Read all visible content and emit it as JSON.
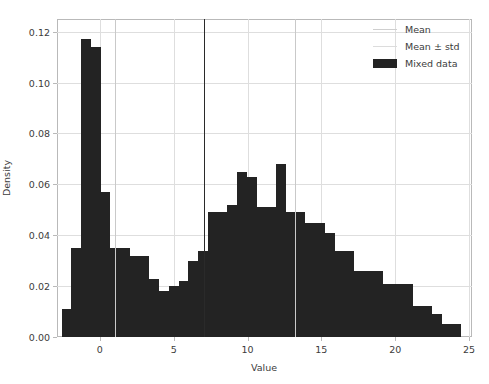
{
  "chart_data": {
    "type": "bar",
    "title": "",
    "xlabel": "Value",
    "ylabel": "Density",
    "xlim": [
      -2.9,
      25.2
    ],
    "ylim": [
      0.0,
      0.125
    ],
    "grid": true,
    "legend_position": "upper right",
    "bin_width": 0.66,
    "x_ticks": [
      0,
      5,
      10,
      15,
      20,
      25
    ],
    "x_tick_labels": [
      "0",
      "5",
      "10",
      "15",
      "20",
      "25"
    ],
    "y_ticks": [
      0.0,
      0.02,
      0.04,
      0.06,
      0.08,
      0.1,
      0.12
    ],
    "y_tick_labels": [
      "0.00",
      "0.02",
      "0.04",
      "0.06",
      "0.08",
      "0.10",
      "0.12"
    ],
    "bar_color": "#232323",
    "mean_line_color": "#2a2a2a",
    "std_line_color": "#c9c9c9",
    "annotations": [
      {
        "name": "mean",
        "x": 7.05,
        "style": "solid-dark"
      },
      {
        "name": "mean-minus-std",
        "x": 1.0,
        "style": "solid-light"
      },
      {
        "name": "mean-plus-std",
        "x": 13.2,
        "style": "solid-light"
      }
    ],
    "bin_left_edges": [
      -2.58,
      -1.92,
      -1.26,
      -0.6,
      0.06,
      0.72,
      1.38,
      2.04,
      2.7,
      3.36,
      4.02,
      4.68,
      5.34,
      6.0,
      6.66,
      7.32,
      7.98,
      8.64,
      9.3,
      9.96,
      10.62,
      11.28,
      11.94,
      12.6,
      13.26,
      13.92,
      14.58,
      15.24,
      15.9,
      16.56,
      17.22,
      17.88,
      18.54,
      19.2,
      19.86,
      20.52,
      21.18,
      21.84,
      22.5,
      23.16,
      23.82
    ],
    "values": [
      0.011,
      0.035,
      0.117,
      0.114,
      0.057,
      0.035,
      0.035,
      0.032,
      0.032,
      0.023,
      0.018,
      0.02,
      0.022,
      0.03,
      0.034,
      0.049,
      0.049,
      0.052,
      0.065,
      0.063,
      0.051,
      0.051,
      0.068,
      0.049,
      0.049,
      0.045,
      0.045,
      0.041,
      0.034,
      0.034,
      0.026,
      0.026,
      0.026,
      0.021,
      0.021,
      0.021,
      0.012,
      0.012,
      0.009,
      0.005,
      0.005
    ],
    "legend": [
      {
        "label": "Mean",
        "marker": "line-dark"
      },
      {
        "label": "Mean ± std",
        "marker": "line-light"
      },
      {
        "label": "Mixed data",
        "marker": "patch"
      }
    ]
  }
}
